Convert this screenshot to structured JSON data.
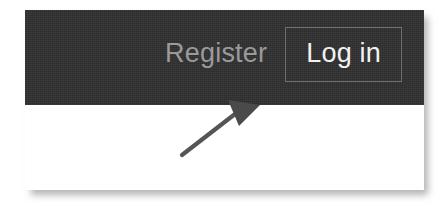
{
  "screenshot": {
    "width": 446,
    "height": 213,
    "background_color": "#ffffff"
  },
  "page_card": {
    "background_color": "#ffffff",
    "shadow_color": "#787878"
  },
  "navbar": {
    "background_color": "#2f2f2f",
    "actions": [
      {
        "name": "register",
        "label": "Register",
        "style": "link",
        "text_color": "#9a9a9a"
      },
      {
        "name": "login",
        "label": "Log in",
        "style": "outlined-button",
        "text_color": "#f2f2f2",
        "border_color": "#6e6e6e"
      }
    ]
  },
  "annotation": {
    "type": "arrow",
    "color": "#555555",
    "points_to": "Log in",
    "description": "hand-drawn arrow pointing up-right at the Log in button"
  }
}
